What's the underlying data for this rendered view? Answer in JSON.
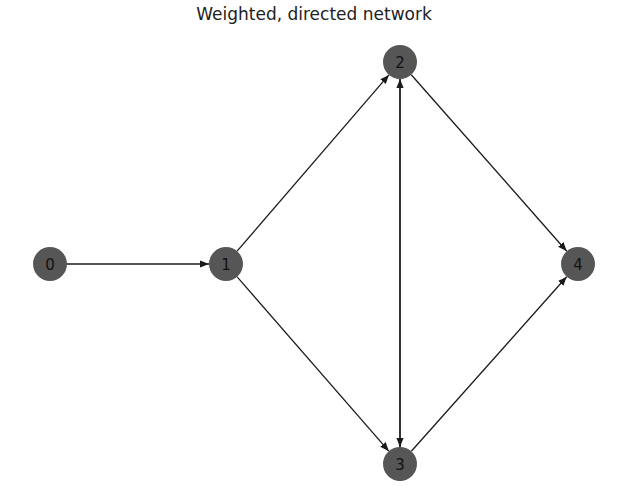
{
  "title": "Weighted, directed network",
  "colors": {
    "node_fill": "#565656",
    "edge": "#1a1a1a",
    "label": "#111111"
  },
  "nodes": [
    {
      "id": "0",
      "x": 50,
      "y": 264
    },
    {
      "id": "1",
      "x": 226,
      "y": 264
    },
    {
      "id": "2",
      "x": 400,
      "y": 62
    },
    {
      "id": "3",
      "x": 400,
      "y": 464
    },
    {
      "id": "4",
      "x": 578,
      "y": 264
    }
  ],
  "edges": [
    {
      "source": "0",
      "target": "1"
    },
    {
      "source": "1",
      "target": "2"
    },
    {
      "source": "1",
      "target": "3"
    },
    {
      "source": "2",
      "target": "3"
    },
    {
      "source": "3",
      "target": "2"
    },
    {
      "source": "2",
      "target": "4"
    },
    {
      "source": "3",
      "target": "4"
    }
  ]
}
